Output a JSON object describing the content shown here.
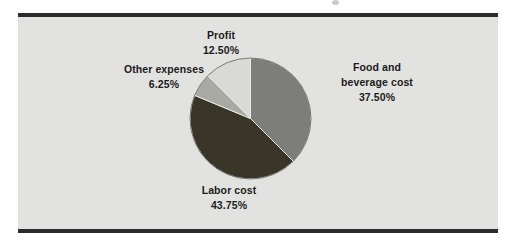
{
  "figure": {
    "background_color": "#ffffff",
    "panel_color": "#e2e2e0",
    "rule_color": "#2b2b2b"
  },
  "chart_data": {
    "type": "pie",
    "title": "",
    "subtitle": "",
    "xlabel": "",
    "ylabel": "",
    "legend_position": "none",
    "grid": false,
    "labels_outside": true,
    "start_angle_deg": 0,
    "direction": "clockwise",
    "categories": [
      "Food and beverage cost",
      "Labor cost",
      "Other expenses",
      "Profit"
    ],
    "values": [
      37.5,
      43.75,
      6.25,
      12.5
    ],
    "value_labels": [
      "37.50%",
      "43.75%",
      "6.25%",
      "12.50%"
    ],
    "colors": [
      "#7d7d7a",
      "#3a3529",
      "#a9a9a4",
      "#d9d9d6"
    ],
    "slices": [
      {
        "name": "Food and beverage cost",
        "name_line1": "Food and",
        "name_line2": "beverage cost",
        "value": 37.5,
        "value_label": "37.50%",
        "color": "#7d7d7a",
        "start_deg": 0,
        "end_deg": 135
      },
      {
        "name": "Labor cost",
        "name_line1": "Labor cost",
        "name_line2": "",
        "value": 43.75,
        "value_label": "43.75%",
        "color": "#3a3529",
        "start_deg": 135,
        "end_deg": 292.5
      },
      {
        "name": "Other expenses",
        "name_line1": "Other expenses",
        "name_line2": "",
        "value": 6.25,
        "value_label": "6.25%",
        "color": "#a9a9a4",
        "start_deg": 292.5,
        "end_deg": 315
      },
      {
        "name": "Profit",
        "name_line1": "Profit",
        "name_line2": "",
        "value": 12.5,
        "value_label": "12.50%",
        "color": "#d9d9d6",
        "start_deg": 315,
        "end_deg": 360
      }
    ],
    "total": 100.0
  },
  "labels": {
    "profit": {
      "name": "Profit",
      "value": "12.50%"
    },
    "other_expenses": {
      "name": "Other expenses",
      "value": "6.25%"
    },
    "food_beverage": {
      "line1": "Food and",
      "line2": "beverage cost",
      "value": "37.50%"
    },
    "labor": {
      "name": "Labor cost",
      "value": "43.75%"
    }
  }
}
